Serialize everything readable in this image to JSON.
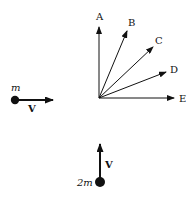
{
  "diagram": {
    "type": "collision-vector-diagram",
    "options": [
      {
        "label": "A",
        "tip": [
          99,
          27
        ],
        "label_pos": [
          96,
          20
        ]
      },
      {
        "label": "B",
        "tip": [
          127,
          31
        ],
        "label_pos": [
          128,
          26
        ]
      },
      {
        "label": "C",
        "tip": [
          153,
          47
        ],
        "label_pos": [
          155,
          43
        ]
      },
      {
        "label": "D",
        "tip": [
          166,
          72
        ],
        "label_pos": [
          170,
          72
        ]
      },
      {
        "label": "E",
        "tip": [
          174,
          98
        ],
        "label_pos": [
          179,
          102
        ]
      }
    ],
    "origin": [
      99,
      98
    ],
    "masses": [
      {
        "name": "left-mass",
        "mass_label": "m",
        "velocity_label": "V",
        "direction": "right"
      },
      {
        "name": "bottom-mass",
        "mass_label": "2m",
        "velocity_label": "V",
        "direction": "up"
      }
    ],
    "colors": {
      "ink": "#111111",
      "background": "#ffffff"
    }
  }
}
